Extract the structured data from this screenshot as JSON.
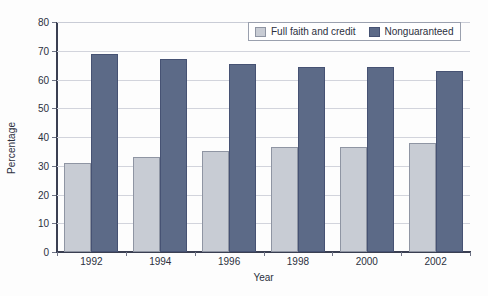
{
  "chart_data": {
    "type": "bar",
    "title": "",
    "subtitle": "",
    "xlabel": "Year",
    "ylabel": "Percentage",
    "categories": [
      "1992",
      "1994",
      "1996",
      "1998",
      "2000",
      "2002"
    ],
    "series": [
      {
        "name": "Full faith and credit",
        "color": "#c8ccd4",
        "values": [
          31,
          33,
          35,
          36.5,
          36.5,
          38
        ]
      },
      {
        "name": "Nonguaranteed",
        "color": "#5c6a87",
        "values": [
          69,
          67,
          65.5,
          64.5,
          64.5,
          63
        ]
      }
    ],
    "ylim": [
      0,
      80
    ],
    "ytick_step": 10,
    "yticks": [
      0,
      10,
      20,
      30,
      40,
      50,
      60,
      70,
      80
    ],
    "ytick_labels": [
      "0",
      "10",
      "20",
      "30",
      "40",
      "50",
      "60",
      "70",
      "80"
    ],
    "grid": "horizontal",
    "legend_position": "top-right-inside"
  },
  "legend": {
    "entries": [
      {
        "label": "Full faith and credit",
        "swatch": "legend-swatch-light"
      },
      {
        "label": "Nonguaranteed",
        "swatch": "legend-swatch-dark"
      }
    ]
  },
  "colors": {
    "series_light": "#c8ccd4",
    "series_dark": "#5c6a87",
    "series_light_edge": "#8f95a3",
    "series_dark_edge": "#465273",
    "gridline": "#d2d4dc",
    "axis": "#3a3f52",
    "text": "#2b3040",
    "background": "#fdfdfd"
  }
}
